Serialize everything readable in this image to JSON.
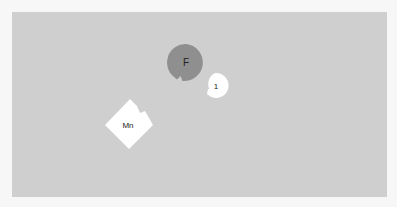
{
  "diagram": {
    "background_color": "#cfcfcf",
    "pieces": [
      {
        "id": "piece-f",
        "label": "F",
        "shape": "circle",
        "fill": "#8f8f8f"
      },
      {
        "id": "piece-1",
        "label": "1",
        "shape": "circle",
        "fill": "#ffffff"
      },
      {
        "id": "piece-mn",
        "label": "Mn",
        "shape": "rotated-square",
        "fill": "#ffffff"
      }
    ]
  }
}
